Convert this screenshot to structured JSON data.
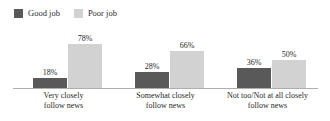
{
  "chart_data": {
    "type": "bar",
    "title": "",
    "subtitle": "",
    "xlabel": "",
    "ylabel": "",
    "ylim": [
      0,
      100
    ],
    "grid": false,
    "legend_position": "top-left",
    "categories": [
      "Very closely\nfollow news",
      "Somewhat closely\nfollow news",
      "Not too/Not at all closely\nfollow news"
    ],
    "category_lines": [
      [
        "Very closely",
        "follow news"
      ],
      [
        "Somewhat closely",
        "follow news"
      ],
      [
        "Not too/Not at all closely",
        "follow news"
      ]
    ],
    "series": [
      {
        "name": "Good job",
        "color": "#595959",
        "values": [
          18,
          28,
          36
        ],
        "labels": [
          "18%",
          "28%",
          "36%"
        ]
      },
      {
        "name": "Poor job",
        "color": "#d2d2d2",
        "values": [
          78,
          66,
          50
        ],
        "labels": [
          "78%",
          "66%",
          "50%"
        ]
      }
    ],
    "axis_color": "#aeaeae"
  },
  "legend": {
    "items": [
      {
        "label": "Good job",
        "color": "#595959",
        "swatch": "legend-swatch-good-job"
      },
      {
        "label": "Poor job",
        "color": "#d2d2d2",
        "swatch": "legend-swatch-poor-job"
      }
    ]
  }
}
